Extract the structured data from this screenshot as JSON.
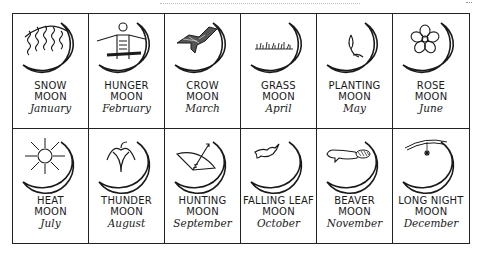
{
  "moons": [
    {
      "name_line1": "SNOW",
      "name_line2": "MOON",
      "month": "January",
      "icon": "snow-wavy-lines-icon"
    },
    {
      "name_line1": "HUNGER",
      "name_line2": "MOON",
      "month": "February",
      "icon": "hungry-figure-icon"
    },
    {
      "name_line1": "CROW",
      "name_line2": "MOON",
      "month": "March",
      "icon": "crow-icon"
    },
    {
      "name_line1": "GRASS",
      "name_line2": "MOON",
      "month": "April",
      "icon": "grass-icon"
    },
    {
      "name_line1": "PLANTING",
      "name_line2": "MOON",
      "month": "May",
      "icon": "sprout-icon"
    },
    {
      "name_line1": "ROSE",
      "name_line2": "MOON",
      "month": "June",
      "icon": "rose-flower-icon"
    },
    {
      "name_line1": "HEAT",
      "name_line2": "MOON",
      "month": "July",
      "icon": "sun-icon"
    },
    {
      "name_line1": "THUNDER",
      "name_line2": "MOON",
      "month": "August",
      "icon": "thunder-symbol-icon"
    },
    {
      "name_line1": "HUNTING",
      "name_line2": "MOON",
      "month": "September",
      "icon": "bow-arrow-icon"
    },
    {
      "name_line1": "FALLING LEAF",
      "name_line2": "MOON",
      "month": "October",
      "icon": "falling-leaf-icon"
    },
    {
      "name_line1": "BEAVER",
      "name_line2": "MOON",
      "month": "November",
      "icon": "beaver-icon"
    },
    {
      "name_line1": "LONG NIGHT",
      "name_line2": "MOON",
      "month": "December",
      "icon": "star-night-icon"
    }
  ]
}
